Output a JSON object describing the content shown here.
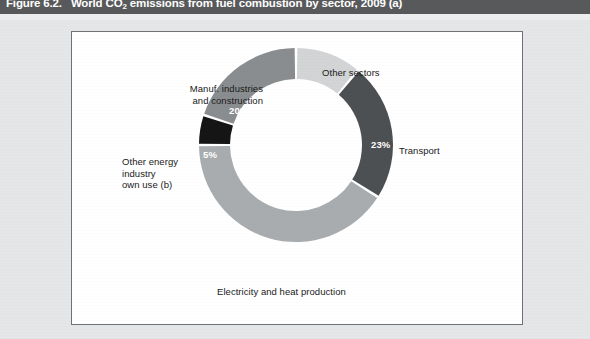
{
  "figure": {
    "number": "Figure 6.2.",
    "title_before_sub": "World CO",
    "title_sub": "2",
    "title_after_sub": " emissions from fuel combustion by sector, 2009 (a)"
  },
  "chart_data": {
    "type": "pie",
    "variant": "donut",
    "title": "World CO2 emissions from fuel combustion by sector, 2009 (a)",
    "unit": "percent",
    "legend_position": "none (direct labels)",
    "grid": false,
    "start_angle_deg": 0,
    "direction": "clockwise",
    "categories": [
      "Other sectors",
      "Transport",
      "Electricity and heat production",
      "Other energy industry own use (b)",
      "Manuf. industries and construction"
    ],
    "values": [
      11,
      23,
      41,
      5,
      20
    ],
    "labels": [
      "11%",
      "23%",
      "41%",
      "5%",
      "20%"
    ],
    "colors": [
      "#d2d4d6",
      "#4d5052",
      "#a9acae",
      "#151515",
      "#8a8d8f"
    ],
    "slices": [
      {
        "name": "Other sectors",
        "value": 11,
        "label": "11%",
        "color": "#d2d4d6"
      },
      {
        "name": "Transport",
        "value": 23,
        "label": "23%",
        "color": "#4d5052"
      },
      {
        "name": "Electricity and heat production",
        "value": 41,
        "label": "41%",
        "color": "#a9acae"
      },
      {
        "name": "Other energy industry own use (b)",
        "value": 5,
        "label": "5%",
        "color": "#151515"
      },
      {
        "name": "Manuf. industries and construction",
        "value": 20,
        "label": "20%",
        "color": "#8a8d8f"
      }
    ]
  },
  "labels": {
    "other_sectors": "Other sectors",
    "transport": "Transport",
    "electricity": "Electricity and heat production",
    "other_energy_line1": "Other energy",
    "other_energy_line2": "industry",
    "other_energy_line3": "own use (b)",
    "manuf_line1": "Manuf. industries",
    "manuf_line2": "and construction"
  },
  "percentages": {
    "other_sectors": "11%",
    "transport": "23%",
    "electricity": "41%",
    "other_energy": "5%",
    "manuf": "20%"
  },
  "theme": {
    "banner_bg": "#58595b",
    "banner_text": "#ffffff",
    "page_bg": "#e4e6e8",
    "frame_bg": "#ffffff",
    "frame_border": "#6e7275"
  }
}
